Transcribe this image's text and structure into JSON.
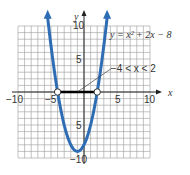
{
  "chart_data": {
    "type": "line",
    "title": "",
    "xlabel": "x",
    "ylabel": "y",
    "xlim": [
      -10,
      10
    ],
    "ylim": [
      -10,
      10
    ],
    "grid": true,
    "x_ticks": [
      "-10",
      "-5",
      "5",
      "10"
    ],
    "y_ticks": [
      "10",
      "5",
      "5",
      "10"
    ],
    "series": [
      {
        "name": "y = x² + 2x − 8",
        "equation": "y = x^2 + 2x - 8",
        "color": "#2e6db4",
        "x": [
          -5.8,
          -5,
          -4,
          -3,
          -2,
          -1,
          0,
          1,
          2,
          3,
          3.8
        ],
        "y": [
          13.2,
          7,
          0,
          -5,
          -8,
          -9,
          -8,
          -5,
          0,
          7,
          14.04
        ]
      }
    ],
    "annotations": [
      {
        "text": "y = x² + 2x − 8",
        "position": "upper right"
      },
      {
        "text": "−4 < x < 2",
        "points_to": [
          -1,
          0
        ]
      }
    ],
    "highlight_interval": {
      "from": -4,
      "to": 2,
      "color": "#000000",
      "endpoints": "open"
    }
  },
  "labels": {
    "x_axis": "x",
    "y_axis": "y",
    "equation": "y = x² + 2x − 8",
    "interval": "−4 < x < 2",
    "tick_x_neg10": "−10",
    "tick_x_neg5": "−5",
    "tick_x_5": "5",
    "tick_x_10": "10",
    "tick_y_10": "10",
    "tick_y_5": "5",
    "tick_y_neg5": "5",
    "tick_y_neg10": "−10"
  }
}
